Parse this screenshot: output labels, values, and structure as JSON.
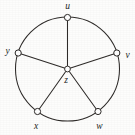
{
  "figure": {
    "kind": "wheel-graph",
    "background_color": "#fdfdfc",
    "line_color": "#2e2b29",
    "vertex_fill_color": "#ffffff",
    "vertex_stroke_color": "#2b2826",
    "label_color": "#221f1d",
    "canvas": {
      "width": 135,
      "height": 135
    },
    "rim": {
      "center_x": 67.5,
      "center_y": 69,
      "radius": 52
    },
    "vertices": [
      {
        "id": "u",
        "label": "u",
        "role": "rim",
        "cx": 67.5,
        "cy": 17.5,
        "r": 3.1,
        "label_x": 67.5,
        "label_y": 6.5,
        "label_anchor": "middle"
      },
      {
        "id": "v",
        "label": "v",
        "role": "rim",
        "cx": 116.8,
        "cy": 53.0,
        "r": 3.1,
        "label_x": 127.5,
        "label_y": 55.5,
        "label_anchor": "middle"
      },
      {
        "id": "w",
        "label": "w",
        "role": "rim",
        "cx": 98.0,
        "cy": 111.5,
        "r": 3.1,
        "label_x": 99.5,
        "label_y": 126.5,
        "label_anchor": "middle"
      },
      {
        "id": "x",
        "label": "x",
        "role": "rim",
        "cx": 37.5,
        "cy": 111.5,
        "r": 3.1,
        "label_x": 36.0,
        "label_y": 126.5,
        "label_anchor": "middle"
      },
      {
        "id": "y",
        "label": "y",
        "role": "rim",
        "cx": 18.2,
        "cy": 53.0,
        "r": 3.1,
        "label_x": 7.5,
        "label_y": 52.0,
        "label_anchor": "middle"
      },
      {
        "id": "z",
        "label": "z",
        "role": "hub",
        "cx": 67.5,
        "cy": 69.0,
        "r": 2.9,
        "label_x": 66.0,
        "label_y": 81.0,
        "label_anchor": "middle"
      }
    ],
    "spokes": [
      {
        "from": "z",
        "to": "u"
      },
      {
        "from": "z",
        "to": "v"
      },
      {
        "from": "z",
        "to": "w"
      },
      {
        "from": "z",
        "to": "x"
      },
      {
        "from": "z",
        "to": "y"
      }
    ],
    "rim_edges": [
      {
        "from": "u",
        "to": "v"
      },
      {
        "from": "v",
        "to": "w"
      },
      {
        "from": "w",
        "to": "x"
      },
      {
        "from": "x",
        "to": "y"
      },
      {
        "from": "y",
        "to": "u"
      }
    ]
  }
}
